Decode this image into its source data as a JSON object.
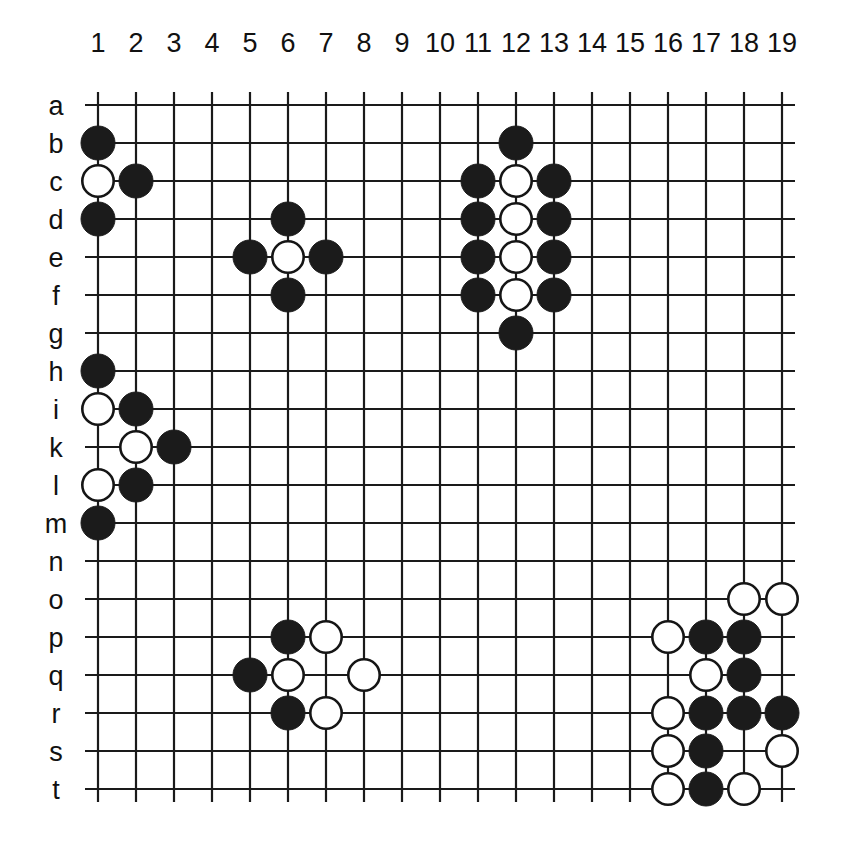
{
  "figure": {
    "kind": "go-board-diagram",
    "board_size": 19,
    "background_color": "#ffffff",
    "line_color": "#1a1a1a",
    "black_stone_color": "#1b1b1b",
    "white_stone_color": "#ffffff",
    "white_stone_border_color": "#151515"
  },
  "geometry": {
    "origin_x": 98,
    "origin_y": 105,
    "step": 38,
    "stone_radius": 17,
    "line_overhang": 13,
    "col_label_y": 52,
    "row_label_x": 56
  },
  "axes": {
    "column_labels": [
      "1",
      "2",
      "3",
      "4",
      "5",
      "6",
      "7",
      "8",
      "9",
      "10",
      "11",
      "12",
      "13",
      "14",
      "15",
      "16",
      "17",
      "18",
      "19"
    ],
    "row_labels": [
      "a",
      "b",
      "c",
      "d",
      "e",
      "f",
      "g",
      "h",
      "i",
      "k",
      "l",
      "m",
      "n",
      "o",
      "p",
      "q",
      "r",
      "s",
      "t"
    ]
  },
  "chart_data": {
    "type": "scatter",
    "title": "",
    "xlabel": "",
    "ylabel": "",
    "categories": [
      "1",
      "2",
      "3",
      "4",
      "5",
      "6",
      "7",
      "8",
      "9",
      "10",
      "11",
      "12",
      "13",
      "14",
      "15",
      "16",
      "17",
      "18",
      "19"
    ],
    "rows": [
      "a",
      "b",
      "c",
      "d",
      "e",
      "f",
      "g",
      "h",
      "i",
      "k",
      "l",
      "m",
      "n",
      "o",
      "p",
      "q",
      "r",
      "s",
      "t"
    ],
    "grid": true,
    "legend": "none",
    "xlim": [
      1,
      19
    ],
    "ylim": [
      1,
      19
    ],
    "black_count": 34,
    "white_count": 23,
    "stones": [
      {
        "col": 1,
        "row": "b",
        "color": "black"
      },
      {
        "col": 1,
        "row": "c",
        "color": "white"
      },
      {
        "col": 2,
        "row": "c",
        "color": "black"
      },
      {
        "col": 1,
        "row": "d",
        "color": "black"
      },
      {
        "col": 6,
        "row": "d",
        "color": "black"
      },
      {
        "col": 5,
        "row": "e",
        "color": "black"
      },
      {
        "col": 6,
        "row": "e",
        "color": "white"
      },
      {
        "col": 7,
        "row": "e",
        "color": "black"
      },
      {
        "col": 6,
        "row": "f",
        "color": "black"
      },
      {
        "col": 12,
        "row": "b",
        "color": "black"
      },
      {
        "col": 11,
        "row": "c",
        "color": "black"
      },
      {
        "col": 12,
        "row": "c",
        "color": "white"
      },
      {
        "col": 13,
        "row": "c",
        "color": "black"
      },
      {
        "col": 11,
        "row": "d",
        "color": "black"
      },
      {
        "col": 12,
        "row": "d",
        "color": "white"
      },
      {
        "col": 13,
        "row": "d",
        "color": "black"
      },
      {
        "col": 11,
        "row": "e",
        "color": "black"
      },
      {
        "col": 12,
        "row": "e",
        "color": "white"
      },
      {
        "col": 13,
        "row": "e",
        "color": "black"
      },
      {
        "col": 11,
        "row": "f",
        "color": "black"
      },
      {
        "col": 12,
        "row": "f",
        "color": "white"
      },
      {
        "col": 13,
        "row": "f",
        "color": "black"
      },
      {
        "col": 12,
        "row": "g",
        "color": "black"
      },
      {
        "col": 1,
        "row": "h",
        "color": "black"
      },
      {
        "col": 1,
        "row": "i",
        "color": "white"
      },
      {
        "col": 2,
        "row": "i",
        "color": "black"
      },
      {
        "col": 2,
        "row": "k",
        "color": "white"
      },
      {
        "col": 3,
        "row": "k",
        "color": "black"
      },
      {
        "col": 1,
        "row": "l",
        "color": "white"
      },
      {
        "col": 2,
        "row": "l",
        "color": "black"
      },
      {
        "col": 1,
        "row": "m",
        "color": "black"
      },
      {
        "col": 6,
        "row": "p",
        "color": "black"
      },
      {
        "col": 7,
        "row": "p",
        "color": "white"
      },
      {
        "col": 5,
        "row": "q",
        "color": "black"
      },
      {
        "col": 6,
        "row": "q",
        "color": "white"
      },
      {
        "col": 8,
        "row": "q",
        "color": "white"
      },
      {
        "col": 6,
        "row": "r",
        "color": "black"
      },
      {
        "col": 7,
        "row": "r",
        "color": "white"
      },
      {
        "col": 18,
        "row": "o",
        "color": "white"
      },
      {
        "col": 19,
        "row": "o",
        "color": "white"
      },
      {
        "col": 16,
        "row": "p",
        "color": "white"
      },
      {
        "col": 17,
        "row": "p",
        "color": "black"
      },
      {
        "col": 18,
        "row": "p",
        "color": "black"
      },
      {
        "col": 17,
        "row": "q",
        "color": "white"
      },
      {
        "col": 18,
        "row": "q",
        "color": "black"
      },
      {
        "col": 16,
        "row": "r",
        "color": "white"
      },
      {
        "col": 17,
        "row": "r",
        "color": "black"
      },
      {
        "col": 18,
        "row": "r",
        "color": "black"
      },
      {
        "col": 19,
        "row": "r",
        "color": "black"
      },
      {
        "col": 16,
        "row": "s",
        "color": "white"
      },
      {
        "col": 17,
        "row": "s",
        "color": "black"
      },
      {
        "col": 19,
        "row": "s",
        "color": "white"
      },
      {
        "col": 16,
        "row": "t",
        "color": "white"
      },
      {
        "col": 17,
        "row": "t",
        "color": "black"
      },
      {
        "col": 18,
        "row": "t",
        "color": "white"
      }
    ]
  }
}
